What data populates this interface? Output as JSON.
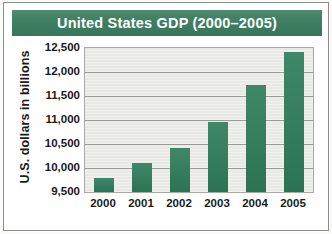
{
  "title": "United States GDP (2000–2005)",
  "colors": {
    "title_band": "#3c7d60",
    "title_text": "#ffffff",
    "bar": "#2f7d5c",
    "plot_background": "#e9e9e6",
    "gridline": "#9b9b97",
    "axis_text": "#1a1a1a",
    "card_background": "#ffffff",
    "card_border": "#8c8c88"
  },
  "chart_data": {
    "type": "bar",
    "title": "United States GDP (2000–2005)",
    "xlabel": "",
    "ylabel": "U.S. dollars in billions",
    "categories": [
      "2000",
      "2001",
      "2002",
      "2003",
      "2004",
      "2005"
    ],
    "values": [
      9800,
      10100,
      10420,
      10950,
      11720,
      12420
    ],
    "ylim": [
      9500,
      12500
    ],
    "ytick_values": [
      9500,
      10000,
      10500,
      11000,
      11500,
      12000,
      12500
    ],
    "ytick_labels": [
      "9,500",
      "10,000",
      "10,500",
      "11,000",
      "11,500",
      "12,000",
      "12,500"
    ],
    "gridline_values": [
      10000,
      10500,
      11000,
      11500,
      12000
    ],
    "grid": true,
    "legend": false,
    "legend_position": "none",
    "series": [
      {
        "name": "U.S. GDP",
        "values": [
          9800,
          10100,
          10420,
          10950,
          11720,
          12420
        ]
      }
    ]
  }
}
